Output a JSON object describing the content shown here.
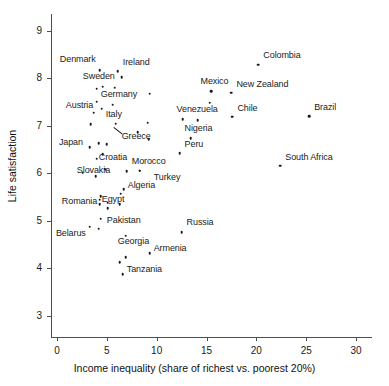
{
  "chart_data": {
    "type": "scatter",
    "title": "",
    "xlabel": "Income inequality (share of richest vs. poorest 20%)",
    "ylabel": "Life satisfaction",
    "xlim": [
      -0.6,
      31.5
    ],
    "ylim": [
      2.55,
      9.35
    ],
    "xticks": [
      0,
      5,
      10,
      15,
      20,
      25,
      30
    ],
    "yticks": [
      3,
      4,
      5,
      6,
      7,
      8,
      9
    ],
    "xtick_labels": [
      "0",
      "5",
      "10",
      "15",
      "20",
      "25",
      "30"
    ],
    "ytick_labels": [
      "3",
      "4",
      "5",
      "6",
      "7",
      "8",
      "9"
    ],
    "grid": false,
    "legend": "none",
    "point_color": "#1a1a1a",
    "axis_color": "#4d4d4d",
    "points": [
      {
        "label": "Denmark",
        "x": 4.3,
        "y": 8.17,
        "label_dx": -40,
        "label_dy": -11
      },
      {
        "label": "Ireland",
        "x": 6.1,
        "y": 8.15,
        "label_dx": 5,
        "label_dy": -9
      },
      {
        "label": "",
        "x": 6.5,
        "y": 8.02,
        "label_dx": 0,
        "label_dy": 0
      },
      {
        "label": "Sweden",
        "x": 4.6,
        "y": 7.82,
        "label_dx": -20,
        "label_dy": -11
      },
      {
        "label": "",
        "x": 4.0,
        "y": 7.78,
        "label_dx": 0,
        "label_dy": 0
      },
      {
        "label": "",
        "x": 5.8,
        "y": 7.8,
        "label_dx": 0,
        "label_dy": 0
      },
      {
        "label": "",
        "x": 9.3,
        "y": 7.67,
        "label_dx": 0,
        "label_dy": 0
      },
      {
        "label": "",
        "x": 4.0,
        "y": 7.5,
        "label_dx": 0,
        "label_dy": 0
      },
      {
        "label": "Germany",
        "x": 5.6,
        "y": 7.44,
        "label_dx": -12,
        "label_dy": -11
      },
      {
        "label": "Austria",
        "x": 4.5,
        "y": 7.36,
        "label_dx": -36,
        "label_dy": -4
      },
      {
        "label": "",
        "x": 3.7,
        "y": 7.27,
        "label_dx": 0,
        "label_dy": 0
      },
      {
        "label": "Chile",
        "x": 17.6,
        "y": 7.19,
        "label_dx": 5,
        "label_dy": -9
      },
      {
        "label": "Brazil",
        "x": 25.3,
        "y": 7.2,
        "label_dx": 5,
        "label_dy": -9
      },
      {
        "label": "Venezuela",
        "x": 12.6,
        "y": 7.13,
        "label_dx": -6,
        "label_dy": -10
      },
      {
        "label": "",
        "x": 14.1,
        "y": 7.12,
        "label_dx": 0,
        "label_dy": 0
      },
      {
        "label": "",
        "x": 9.1,
        "y": 7.06,
        "label_dx": 0,
        "label_dy": 0
      },
      {
        "label": "Italy",
        "x": 5.9,
        "y": 7.04,
        "label_dx": -10,
        "label_dy": -10
      },
      {
        "label": "",
        "x": 3.4,
        "y": 7.03,
        "label_dx": 0,
        "label_dy": 0
      },
      {
        "label": "Greece",
        "x": 8.1,
        "y": 6.86,
        "label_dx": -16,
        "label_dy": 4
      },
      {
        "label": "Nigeria",
        "x": 13.4,
        "y": 6.74,
        "label_dx": -6,
        "label_dy": -10
      },
      {
        "label": "",
        "x": 9.2,
        "y": 6.71,
        "label_dx": 0,
        "label_dy": 0
      },
      {
        "label": "",
        "x": 4.2,
        "y": 6.63,
        "label_dx": 0,
        "label_dy": 0
      },
      {
        "label": "",
        "x": 5.0,
        "y": 6.61,
        "label_dx": 0,
        "label_dy": 0
      },
      {
        "label": "Japan",
        "x": 3.3,
        "y": 6.54,
        "label_dx": -31,
        "label_dy": -5
      },
      {
        "label": "Peru",
        "x": 12.3,
        "y": 6.42,
        "label_dx": 5,
        "label_dy": -9
      },
      {
        "label": "Croatia",
        "x": 4.6,
        "y": 6.4,
        "label_dx": -4,
        "label_dy": 3
      },
      {
        "label": "",
        "x": 4.0,
        "y": 6.3,
        "label_dx": 0,
        "label_dy": 0
      },
      {
        "label": "South Africa",
        "x": 22.4,
        "y": 6.16,
        "label_dx": 5,
        "label_dy": -9
      },
      {
        "label": "Slovakia",
        "x": 4.8,
        "y": 6.09,
        "label_dx": -28,
        "label_dy": 1
      },
      {
        "label": "",
        "x": 4.9,
        "y": 6.07,
        "label_dx": 0,
        "label_dy": 0
      },
      {
        "label": "Morocco",
        "x": 7.0,
        "y": 6.04,
        "label_dx": 5,
        "label_dy": -10
      },
      {
        "label": "",
        "x": 8.3,
        "y": 6.05,
        "label_dx": 0,
        "label_dy": 0
      },
      {
        "label": "",
        "x": 2.6,
        "y": 6.01,
        "label_dx": 0,
        "label_dy": 0
      },
      {
        "label": "",
        "x": 3.9,
        "y": 5.94,
        "label_dx": 0,
        "label_dy": 0
      },
      {
        "label": "Turkey",
        "x": 8.3,
        "y": 6.05,
        "label_dx": 14,
        "label_dy": 6
      },
      {
        "label": "Algeria",
        "x": 6.7,
        "y": 5.66,
        "label_dx": 4,
        "label_dy": -4
      },
      {
        "label": "",
        "x": 6.4,
        "y": 5.57,
        "label_dx": 0,
        "label_dy": 0
      },
      {
        "label": "",
        "x": 4.4,
        "y": 5.52,
        "label_dx": 0,
        "label_dy": 0
      },
      {
        "label": "Romania",
        "x": 4.3,
        "y": 5.44,
        "label_dx": -38,
        "label_dy": 1
      },
      {
        "label": "Egypt",
        "x": 5.1,
        "y": 5.38,
        "label_dx": -6,
        "label_dy": -4
      },
      {
        "label": "",
        "x": 4.3,
        "y": 5.35,
        "label_dx": 0,
        "label_dy": 0
      },
      {
        "label": "",
        "x": 6.3,
        "y": 5.35,
        "label_dx": 0,
        "label_dy": 0
      },
      {
        "label": "",
        "x": 5.1,
        "y": 5.26,
        "label_dx": 0,
        "label_dy": 0
      },
      {
        "label": "Pakistan",
        "x": 4.4,
        "y": 5.04,
        "label_dx": 6,
        "label_dy": 1
      },
      {
        "label": "Russia",
        "x": 12.5,
        "y": 4.76,
        "label_dx": 5,
        "label_dy": -10
      },
      {
        "label": "Belarus",
        "x": 3.3,
        "y": 4.87,
        "label_dx": -34,
        "label_dy": 6
      },
      {
        "label": "",
        "x": 4.2,
        "y": 4.83,
        "label_dx": 0,
        "label_dy": 0
      },
      {
        "label": "Georgia",
        "x": 6.9,
        "y": 4.68,
        "label_dx": -8,
        "label_dy": 5
      },
      {
        "label": "Armenia",
        "x": 9.3,
        "y": 4.31,
        "label_dx": 4,
        "label_dy": -5
      },
      {
        "label": "",
        "x": 6.9,
        "y": 4.23,
        "label_dx": 0,
        "label_dy": 0
      },
      {
        "label": "",
        "x": 6.3,
        "y": 4.13,
        "label_dx": 0,
        "label_dy": 0
      },
      {
        "label": "Tanzania",
        "x": 6.6,
        "y": 3.87,
        "label_dx": 4,
        "label_dy": -5
      },
      {
        "label": "Colombia",
        "x": 20.2,
        "y": 8.28,
        "label_dx": 5,
        "label_dy": -10
      },
      {
        "label": "Mexico",
        "x": 15.5,
        "y": 7.73,
        "label_dx": -11,
        "label_dy": -10
      },
      {
        "label": "New Zealand",
        "x": 17.5,
        "y": 7.69,
        "label_dx": 5,
        "label_dy": -9
      },
      {
        "label": "",
        "x": 15.3,
        "y": 7.48,
        "label_dx": 0,
        "label_dy": 0
      }
    ]
  }
}
